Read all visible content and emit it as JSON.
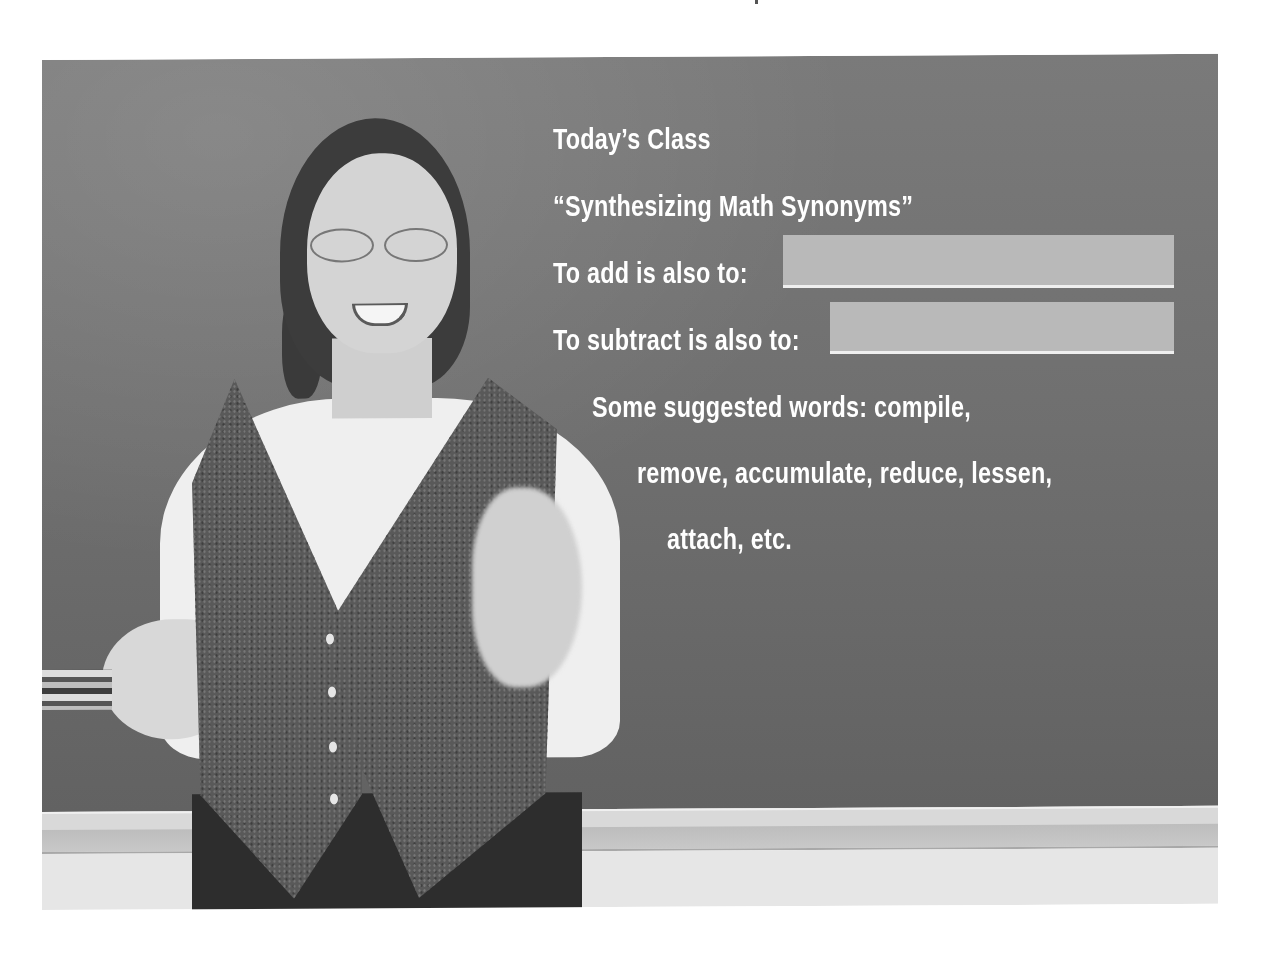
{
  "board": {
    "title": "Today’s Class",
    "lesson": "“Synthesizing Math Synonyms”",
    "prompt_add": "To add is also to:",
    "prompt_subtract": "To subtract is also to:",
    "answer_add": "",
    "answer_subtract": "",
    "suggestions_line1": "Some suggested words: compile,",
    "suggestions_line2": "remove, accumulate, reduce, lessen,",
    "suggestions_line3": "attach, etc."
  },
  "colors": {
    "chalkboard": "#6f6f6f",
    "chalk_text": "#ffffff",
    "blank_fill": "#b9b9b9",
    "background": "#ffffff"
  }
}
